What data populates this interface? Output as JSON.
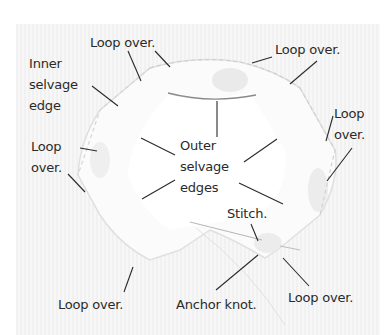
{
  "diagram": {
    "colors": {
      "background": "#ffffff",
      "photo_background": "#f4f4f4",
      "fabric": "#fbfbfb",
      "fabric_shadow": "#dcdcdc",
      "leader_line": "#2a2a2a",
      "label_text": "#2a2a2a",
      "thread": "#9a9a9a"
    },
    "labels": {
      "loop_over_top_left": "Loop over.",
      "loop_over_top_right": "Loop over.",
      "inner_selvage_edge": [
        "Inner",
        "selvage",
        "edge"
      ],
      "loop_over_left": [
        "Loop",
        "over."
      ],
      "loop_over_right": [
        "Loop",
        "over."
      ],
      "outer_selvage_edges": [
        "Outer",
        "selvage",
        "edges"
      ],
      "stitch": "Stitch.",
      "loop_over_bottom_left": "Loop over.",
      "anchor_knot": "Anchor knot.",
      "loop_over_bottom_right": "Loop over."
    }
  }
}
